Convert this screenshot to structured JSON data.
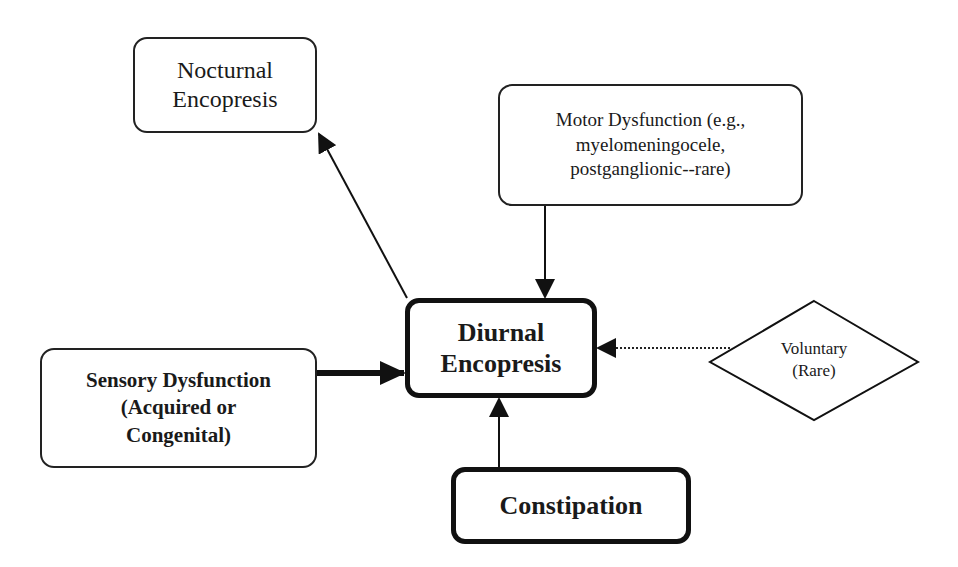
{
  "diagram": {
    "type": "causal flow diagram",
    "nodes": {
      "nocturnal": {
        "label": "Nocturnal\nEncopresis",
        "shape": "rounded-rectangle",
        "border": "thin"
      },
      "motor": {
        "label": "Motor Dysfunction (e.g.,\nmyelomeningocele,\npostganglionic--rare)",
        "shape": "rounded-rectangle",
        "border": "thin"
      },
      "diurnal": {
        "label": "Diurnal\nEncopresis",
        "shape": "rounded-rectangle",
        "border": "thick"
      },
      "sensory": {
        "label": "Sensory Dysfunction\n(Acquired or\nCongenital)",
        "shape": "rounded-rectangle",
        "border": "thin"
      },
      "constipation": {
        "label": "Constipation",
        "shape": "rounded-rectangle",
        "border": "thick"
      },
      "voluntary": {
        "label": "Voluntary\n(Rare)",
        "shape": "diamond",
        "border": "thin"
      }
    },
    "edges": [
      {
        "from": "diurnal",
        "to": "nocturnal",
        "style": "thin-solid"
      },
      {
        "from": "motor",
        "to": "diurnal",
        "style": "thin-solid"
      },
      {
        "from": "sensory",
        "to": "diurnal",
        "style": "thick-solid"
      },
      {
        "from": "voluntary",
        "to": "diurnal",
        "style": "dotted"
      },
      {
        "from": "constipation",
        "to": "diurnal",
        "style": "thin-solid"
      }
    ],
    "colors": {
      "stroke": "#111111",
      "background": "#ffffff"
    }
  }
}
